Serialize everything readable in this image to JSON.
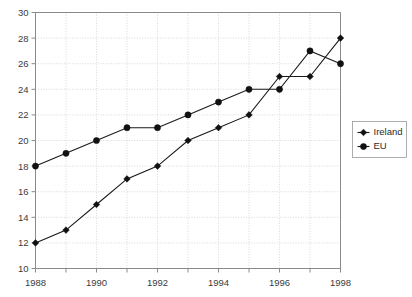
{
  "chart_data": {
    "type": "line",
    "title": "",
    "xlabel": "",
    "ylabel": "",
    "x": [
      1988,
      1989,
      1990,
      1991,
      1992,
      1993,
      1994,
      1995,
      1996,
      1997,
      1998
    ],
    "categories": [
      "1988",
      "1989",
      "1990",
      "1991",
      "1992",
      "1993",
      "1994",
      "1995",
      "1996",
      "1997",
      "1998"
    ],
    "series": [
      {
        "name": "Ireland",
        "marker": "diamond",
        "color": "#111111",
        "values": [
          12,
          13,
          15,
          17,
          18,
          20,
          21,
          22,
          25,
          25,
          28
        ]
      },
      {
        "name": "EU",
        "marker": "circle",
        "color": "#111111",
        "values": [
          18,
          19,
          20,
          21,
          21,
          22,
          23,
          24,
          24,
          27,
          26
        ]
      }
    ],
    "ylim": [
      10,
      30
    ],
    "ytick_step": 2,
    "yticks": [
      10,
      12,
      14,
      16,
      18,
      20,
      22,
      24,
      26,
      28,
      30
    ],
    "ytick_labels": [
      "10",
      "12",
      "14",
      "16",
      "18",
      "20",
      "22",
      "24",
      "26",
      "28",
      "30"
    ],
    "xlim": [
      1988,
      1998
    ],
    "xticks": [
      1988,
      1989,
      1990,
      1991,
      1992,
      1993,
      1994,
      1995,
      1996,
      1997,
      1998
    ],
    "xtick_labels_shown": [
      "1988",
      "1990",
      "1992",
      "1994",
      "1996",
      "1998"
    ],
    "grid": true,
    "grid_color": "#c8c8c8",
    "legend_position": "right",
    "legend_entries": [
      "Ireland",
      "EU"
    ],
    "axis_color": "#8a8a8a",
    "background": "#ffffff"
  },
  "legend": {
    "items": [
      {
        "label": "Ireland",
        "marker": "diamond"
      },
      {
        "label": "EU",
        "marker": "circle"
      }
    ]
  }
}
